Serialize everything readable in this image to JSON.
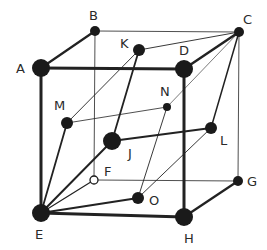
{
  "diagram": {
    "type": "crystal-lattice-cube",
    "nodes": [
      {
        "id": "A",
        "label": "A",
        "x": 41,
        "y": 68,
        "r": 9,
        "lx": 16,
        "ly": 73
      },
      {
        "id": "B",
        "label": "B",
        "x": 95,
        "y": 31,
        "r": 5,
        "lx": 89,
        "ly": 20
      },
      {
        "id": "C",
        "label": "C",
        "x": 239,
        "y": 32,
        "r": 5,
        "lx": 243,
        "ly": 24
      },
      {
        "id": "D",
        "label": "D",
        "x": 184,
        "y": 69,
        "r": 9,
        "lx": 179,
        "ly": 55
      },
      {
        "id": "K",
        "label": "K",
        "x": 139,
        "y": 50,
        "r": 6,
        "lx": 120,
        "ly": 48
      },
      {
        "id": "M",
        "label": "M",
        "x": 67,
        "y": 123,
        "r": 6,
        "lx": 54,
        "ly": 110
      },
      {
        "id": "N",
        "label": "N",
        "x": 167,
        "y": 107,
        "r": 4,
        "lx": 160,
        "ly": 96
      },
      {
        "id": "J",
        "label": "J",
        "x": 112,
        "y": 141,
        "r": 9,
        "lx": 128,
        "ly": 158
      },
      {
        "id": "L",
        "label": "L",
        "x": 211,
        "y": 128,
        "r": 6,
        "lx": 220,
        "ly": 145
      },
      {
        "id": "F",
        "label": "F",
        "x": 94,
        "y": 180,
        "r": 4,
        "lx": 104,
        "ly": 176,
        "hollow": true
      },
      {
        "id": "G",
        "label": "G",
        "x": 238,
        "y": 181,
        "r": 5,
        "lx": 247,
        "ly": 186
      },
      {
        "id": "O",
        "label": "O",
        "x": 138,
        "y": 198,
        "r": 6,
        "lx": 149,
        "ly": 205
      },
      {
        "id": "E",
        "label": "E",
        "x": 41,
        "y": 213,
        "r": 9,
        "lx": 35,
        "ly": 239
      },
      {
        "id": "H",
        "label": "H",
        "x": 184,
        "y": 217,
        "r": 9,
        "lx": 184,
        "ly": 243
      }
    ],
    "edges": [
      {
        "from": "A",
        "to": "B",
        "w": 2.2
      },
      {
        "from": "A",
        "to": "D",
        "w": 3
      },
      {
        "from": "A",
        "to": "E",
        "w": 3
      },
      {
        "from": "B",
        "to": "C",
        "w": 0.8
      },
      {
        "from": "B",
        "to": "F",
        "w": 0.8
      },
      {
        "from": "C",
        "to": "D",
        "w": 2.5
      },
      {
        "from": "C",
        "to": "G",
        "w": 0.8
      },
      {
        "from": "C",
        "to": "K",
        "w": 0.9
      },
      {
        "from": "C",
        "to": "N",
        "w": 0.6
      },
      {
        "from": "C",
        "to": "L",
        "w": 1.5
      },
      {
        "from": "D",
        "to": "H",
        "w": 3
      },
      {
        "from": "E",
        "to": "H",
        "w": 3
      },
      {
        "from": "G",
        "to": "H",
        "w": 2.2
      },
      {
        "from": "F",
        "to": "G",
        "w": 0.8
      },
      {
        "from": "E",
        "to": "F",
        "w": 1.2
      },
      {
        "from": "K",
        "to": "M",
        "w": 0.9
      },
      {
        "from": "K",
        "to": "J",
        "w": 1.8
      },
      {
        "from": "M",
        "to": "N",
        "w": 0.8
      },
      {
        "from": "M",
        "to": "E",
        "w": 1.8
      },
      {
        "from": "J",
        "to": "L",
        "w": 2
      },
      {
        "from": "J",
        "to": "E",
        "w": 2
      },
      {
        "from": "N",
        "to": "O",
        "w": 0.9
      },
      {
        "from": "L",
        "to": "O",
        "w": 0.9
      },
      {
        "from": "O",
        "to": "E",
        "w": 2.2
      }
    ],
    "colors": {
      "node": "#1a1a1a",
      "edge": "#222222",
      "label": "#2a2a2a"
    }
  }
}
